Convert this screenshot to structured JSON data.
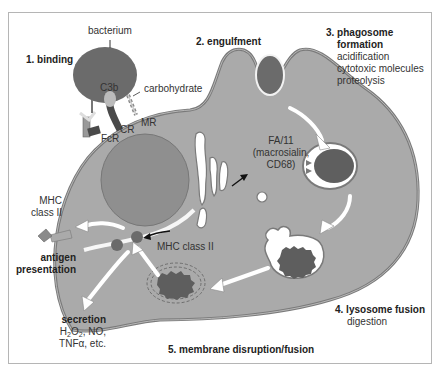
{
  "colors": {
    "cell_fill": "#aaaaaa",
    "membrane": "#7a7a7a",
    "nucleus_fill": "#8f8f8f",
    "bacterium_fill": "#6b6b6b",
    "dark_debris": "#5e5e5e",
    "vesicle_light": "#ffffff",
    "text": "#333333"
  },
  "steps": {
    "binding": "1. binding",
    "engulfment": "2. engulfment",
    "phagosome_title_line1": "3. phagosome",
    "phagosome_title_line2": "formation",
    "phagosome_items": [
      "acidification",
      "cytotoxic molecules",
      "proteolysis"
    ],
    "lysosome_title": "4. lysosome fusion",
    "lysosome_item": "digestion",
    "membrane": "5. membrane disruption/fusion"
  },
  "labels": {
    "bacterium": "bacterium",
    "c3b": "C3b",
    "carbohydrate": "carbohydrate",
    "fcr": "FcR",
    "cr": "CR",
    "mr": "MR",
    "fa11_line1": "FA/11",
    "fa11_line2": "(macrosialin,",
    "fa11_line3": "CD68)",
    "mhc_outside_line1": "MHC",
    "mhc_outside_line2": "class II",
    "mhc_inside": "MHC class II",
    "antigen_line1": "antigen",
    "antigen_line2": "presentation",
    "secretion_title": "secretion",
    "secretion_h": "H",
    "secretion_sub2a": "2",
    "secretion_o": "O",
    "secretion_sub2b": "2",
    "secretion_rest": ", NO,",
    "secretion_line3": "TNFα, etc."
  }
}
